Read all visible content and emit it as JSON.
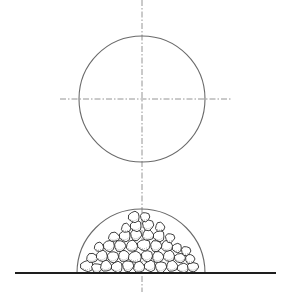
{
  "figure": {
    "type": "technical-illustration",
    "canvas": {
      "width": 287,
      "height": 292
    },
    "colors": {
      "outline": "#6a6a6a",
      "axis": "#7a7a7a",
      "ground": "#1e1e1e",
      "pebble_stroke": "#2a2a2a",
      "background": "#ffffff"
    },
    "vertical_axis": {
      "x": 142,
      "y1": 0,
      "y2": 292
    },
    "upper_circle": {
      "cx": 142,
      "cy": 99,
      "r": 63,
      "horizontal_axis": {
        "x1": 60,
        "x2": 232,
        "y": 99
      }
    },
    "lower_semicircle": {
      "cx": 141,
      "cy": 273,
      "r": 64
    },
    "ground_line": {
      "x1": 15,
      "x2": 276,
      "y": 273
    },
    "pebbles": [
      {
        "cx": 87,
        "cy": 266,
        "rx": 7,
        "ry": 6
      },
      {
        "cx": 97,
        "cy": 268,
        "rx": 6,
        "ry": 5
      },
      {
        "cx": 106,
        "cy": 266,
        "rx": 6,
        "ry": 6
      },
      {
        "cx": 117,
        "cy": 267,
        "rx": 6,
        "ry": 6
      },
      {
        "cx": 128,
        "cy": 266,
        "rx": 6,
        "ry": 6
      },
      {
        "cx": 139,
        "cy": 267,
        "rx": 6,
        "ry": 6
      },
      {
        "cx": 150,
        "cy": 266,
        "rx": 6,
        "ry": 6
      },
      {
        "cx": 161,
        "cy": 267,
        "rx": 6,
        "ry": 6
      },
      {
        "cx": 172,
        "cy": 266,
        "rx": 6,
        "ry": 6
      },
      {
        "cx": 183,
        "cy": 268,
        "rx": 6,
        "ry": 5
      },
      {
        "cx": 193,
        "cy": 267,
        "rx": 6,
        "ry": 5
      },
      {
        "cx": 92,
        "cy": 258,
        "rx": 6,
        "ry": 5
      },
      {
        "cx": 102,
        "cy": 256,
        "rx": 6,
        "ry": 6
      },
      {
        "cx": 113,
        "cy": 257,
        "rx": 6,
        "ry": 6
      },
      {
        "cx": 124,
        "cy": 256,
        "rx": 6,
        "ry": 6
      },
      {
        "cx": 135,
        "cy": 257,
        "rx": 7,
        "ry": 6
      },
      {
        "cx": 147,
        "cy": 256,
        "rx": 6,
        "ry": 6
      },
      {
        "cx": 158,
        "cy": 257,
        "rx": 6,
        "ry": 6
      },
      {
        "cx": 169,
        "cy": 256,
        "rx": 6,
        "ry": 6
      },
      {
        "cx": 180,
        "cy": 258,
        "rx": 6,
        "ry": 5
      },
      {
        "cx": 190,
        "cy": 259,
        "rx": 5,
        "ry": 5
      },
      {
        "cx": 99,
        "cy": 247,
        "rx": 5,
        "ry": 5
      },
      {
        "cx": 109,
        "cy": 246,
        "rx": 6,
        "ry": 6
      },
      {
        "cx": 120,
        "cy": 246,
        "rx": 6,
        "ry": 6
      },
      {
        "cx": 132,
        "cy": 246,
        "rx": 6,
        "ry": 6
      },
      {
        "cx": 144,
        "cy": 245,
        "rx": 7,
        "ry": 6
      },
      {
        "cx": 156,
        "cy": 246,
        "rx": 6,
        "ry": 6
      },
      {
        "cx": 167,
        "cy": 246,
        "rx": 6,
        "ry": 6
      },
      {
        "cx": 177,
        "cy": 248,
        "rx": 5,
        "ry": 5
      },
      {
        "cx": 186,
        "cy": 251,
        "rx": 5,
        "ry": 5
      },
      {
        "cx": 114,
        "cy": 237,
        "rx": 6,
        "ry": 5
      },
      {
        "cx": 125,
        "cy": 236,
        "rx": 6,
        "ry": 6
      },
      {
        "cx": 136,
        "cy": 235,
        "rx": 6,
        "ry": 6
      },
      {
        "cx": 148,
        "cy": 235,
        "rx": 6,
        "ry": 6
      },
      {
        "cx": 159,
        "cy": 236,
        "rx": 6,
        "ry": 6
      },
      {
        "cx": 170,
        "cy": 238,
        "rx": 5,
        "ry": 5
      },
      {
        "cx": 126,
        "cy": 228,
        "rx": 5,
        "ry": 5
      },
      {
        "cx": 136,
        "cy": 226,
        "rx": 6,
        "ry": 6
      },
      {
        "cx": 148,
        "cy": 225,
        "rx": 6,
        "ry": 6
      },
      {
        "cx": 160,
        "cy": 227,
        "rx": 5,
        "ry": 5
      },
      {
        "cx": 134,
        "cy": 217,
        "rx": 6,
        "ry": 6
      },
      {
        "cx": 145,
        "cy": 217,
        "rx": 5,
        "ry": 5
      }
    ]
  }
}
